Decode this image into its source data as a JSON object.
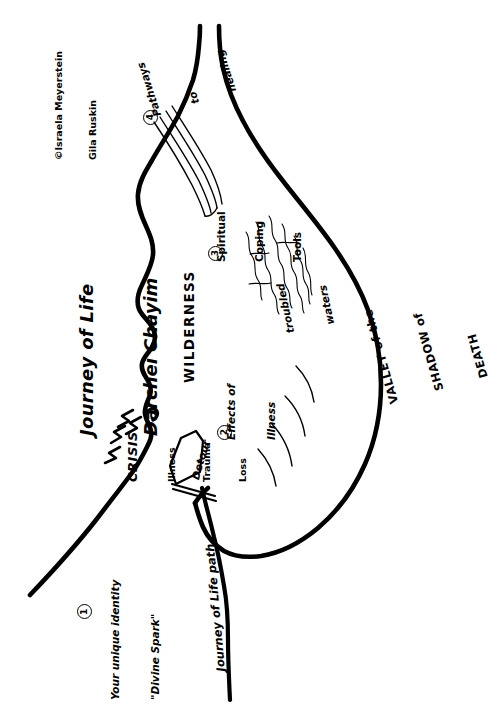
{
  "meta": {
    "kind": "hand-drawn-diagram",
    "ink_color": "#000000",
    "background_color": "#ffffff",
    "orientation": "all text rotated 90 degrees counter-clockwise"
  },
  "title": {
    "line1": "Journey of Life",
    "line2": "Darchei Chayim"
  },
  "credit": {
    "line1": "©Israela Meyerstein",
    "line2": "Gila Ruskin"
  },
  "numbered_stops": [
    {
      "number": "1",
      "marker": "①",
      "line1": "Your unique identity",
      "line2": "\"Divine Spark\""
    },
    {
      "number": "2",
      "marker": "②",
      "line1": "Effects of",
      "line2": "Illness"
    },
    {
      "number": "3",
      "marker": "③",
      "line1": "Spiritual",
      "line2": "Coping",
      "line3": "Tools"
    },
    {
      "number": "4",
      "marker": "④",
      "line1": "Pathways",
      "line2": "to",
      "line3": "healing"
    }
  ],
  "crisis": {
    "heading": "CRISIS",
    "items": [
      "Illness",
      "Trauma",
      "Loss"
    ]
  },
  "sign": {
    "label": "Detour"
  },
  "regions": {
    "wilderness": "WILDERNESS",
    "troubled_waters_line1": "troubled",
    "troubled_waters_line2": "waters",
    "valley_line1": "VALLEY of the",
    "valley_line2": "SHADOW of",
    "valley_line3": "DEATH"
  },
  "path": {
    "label": "Journey of Life path"
  }
}
